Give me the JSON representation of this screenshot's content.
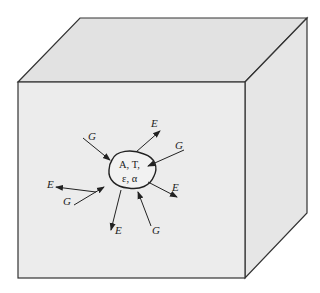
{
  "diagram": {
    "enclosure": {
      "shape": "cube",
      "face_colors": {
        "front": "#ececec",
        "top": "#e2e2e2",
        "side": "#e6e6e6"
      },
      "edge_color": "#333333"
    },
    "body": {
      "line1": "A, T,",
      "line2": "ε, α"
    },
    "arrows": [
      {
        "label": "G",
        "direction": "incoming",
        "position": "upper-left"
      },
      {
        "label": "E",
        "direction": "outgoing",
        "position": "upper-right"
      },
      {
        "label": "G",
        "direction": "incoming",
        "position": "right"
      },
      {
        "label": "E",
        "direction": "outgoing",
        "position": "left"
      },
      {
        "label": "E",
        "direction": "outgoing",
        "position": "lower-right"
      },
      {
        "label": "G",
        "direction": "incoming",
        "position": "lower-left"
      },
      {
        "label": "E",
        "direction": "outgoing",
        "position": "bottom"
      },
      {
        "label": "G",
        "direction": "incoming",
        "position": "bottom-right"
      }
    ]
  }
}
